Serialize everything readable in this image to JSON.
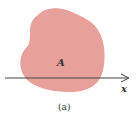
{
  "figure": {
    "region_label": "A",
    "axis_label": "x",
    "caption": "(a)",
    "colors": {
      "region_fill": "#e8a09b",
      "axis_line": "#444444",
      "text": "#333333",
      "background": "#ffffff"
    }
  }
}
